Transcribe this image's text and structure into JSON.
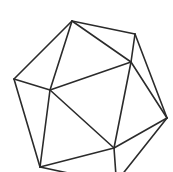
{
  "figure": {
    "stroke_color": "#2b2b2b",
    "background": "#ffffff",
    "vertices": {
      "A": [
        72,
        21
      ],
      "B": [
        135,
        34
      ],
      "L": [
        14,
        79
      ],
      "C": [
        50,
        90
      ],
      "D": [
        131,
        62
      ],
      "R": [
        167,
        118
      ],
      "F": [
        114,
        148
      ],
      "E": [
        40,
        167
      ],
      "X1": [
        82,
        176
      ],
      "X2": [
        116,
        176
      ],
      "X3": [
        121,
        176
      ]
    },
    "edges": [
      [
        "A",
        "B"
      ],
      [
        "A",
        "L"
      ],
      [
        "A",
        "C"
      ],
      [
        "A",
        "D"
      ],
      [
        "B",
        "D"
      ],
      [
        "B",
        "R"
      ],
      [
        "L",
        "C"
      ],
      [
        "L",
        "E"
      ],
      [
        "C",
        "D"
      ],
      [
        "C",
        "E"
      ],
      [
        "C",
        "F"
      ],
      [
        "D",
        "F"
      ],
      [
        "D",
        "R"
      ],
      [
        "R",
        "F"
      ],
      [
        "F",
        "E"
      ],
      [
        "E",
        "X1"
      ],
      [
        "F",
        "X2"
      ],
      [
        "R",
        "X3"
      ]
    ]
  }
}
